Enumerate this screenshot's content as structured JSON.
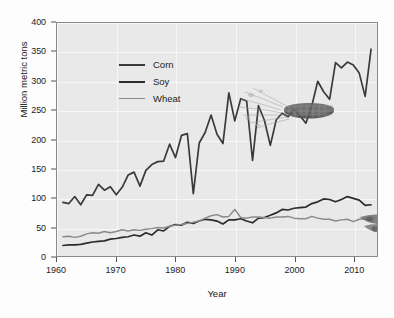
{
  "chart_data": {
    "type": "line",
    "title": "",
    "xlabel": "Year",
    "ylabel": "Million metric tons",
    "xlim": [
      1960,
      2014
    ],
    "ylim": [
      0,
      400
    ],
    "grid": true,
    "legend_position": "top-left",
    "xticks": [
      1960,
      1970,
      1980,
      1990,
      2000,
      2010
    ],
    "yticks": [
      0,
      50,
      100,
      150,
      200,
      250,
      300,
      350,
      400
    ],
    "x": [
      1961,
      1962,
      1963,
      1964,
      1965,
      1966,
      1967,
      1968,
      1969,
      1970,
      1971,
      1972,
      1973,
      1974,
      1975,
      1976,
      1977,
      1978,
      1979,
      1980,
      1981,
      1982,
      1983,
      1984,
      1985,
      1986,
      1987,
      1988,
      1989,
      1990,
      1991,
      1992,
      1993,
      1994,
      1995,
      1996,
      1997,
      1998,
      1999,
      2000,
      2001,
      2002,
      2003,
      2004,
      2005,
      2006,
      2007,
      2008,
      2009,
      2010,
      2011,
      2012,
      2013
    ],
    "series": [
      {
        "name": "Corn",
        "color": "#3a3a3a",
        "values": [
          92,
          90,
          102,
          88,
          105,
          104,
          123,
          113,
          119,
          105,
          118,
          139,
          144,
          120,
          147,
          157,
          162,
          163,
          192,
          169,
          207,
          210,
          107,
          194,
          212,
          242,
          209,
          193,
          280,
          232,
          270,
          266,
          164,
          258,
          233,
          190,
          234,
          245,
          239,
          252,
          241,
          228,
          258,
          300,
          282,
          269,
          332,
          323,
          333,
          328,
          314,
          274,
          355
        ]
      },
      {
        "name": "Soy",
        "color": "#2b2b2b",
        "values": [
          18,
          19,
          19,
          20,
          22,
          24,
          25,
          26,
          29,
          30,
          32,
          33,
          36,
          34,
          40,
          36,
          45,
          43,
          51,
          54,
          53,
          58,
          56,
          60,
          63,
          62,
          60,
          55,
          62,
          62,
          64,
          60,
          57,
          65,
          66,
          70,
          74,
          80,
          79,
          82,
          83,
          84,
          90,
          93,
          98,
          97,
          93,
          97,
          102,
          99,
          96,
          87,
          88
        ]
      },
      {
        "name": "Wheat",
        "color": "#8a8a8a",
        "values": [
          33,
          34,
          32,
          34,
          38,
          40,
          39,
          42,
          40,
          42,
          45,
          43,
          45,
          44,
          46,
          47,
          49,
          48,
          51,
          53,
          54,
          56,
          58,
          60,
          65,
          69,
          71,
          67,
          68,
          80,
          66,
          65,
          67,
          67,
          66,
          65,
          67,
          67,
          68,
          65,
          64,
          64,
          68,
          65,
          63,
          63,
          60,
          62,
          63,
          59,
          63,
          64,
          62
        ]
      }
    ]
  },
  "axes": {
    "y_title": "Million metric tons",
    "x_title": "Year",
    "y_tick_labels": [
      "0",
      "50",
      "100",
      "150",
      "200",
      "250",
      "300",
      "350",
      "400"
    ],
    "x_tick_labels": [
      "1960",
      "1970",
      "1980",
      "1990",
      "2000",
      "2010"
    ]
  },
  "legend": {
    "items": [
      {
        "label": "Corn",
        "color": "#3a3a3a"
      },
      {
        "label": "Soy",
        "color": "#2b2b2b"
      },
      {
        "label": "Wheat",
        "color": "#8a8a8a"
      }
    ]
  },
  "illustrations": [
    {
      "name": "corn-cob",
      "label": "corn"
    },
    {
      "name": "soybean-pods",
      "label": "soy"
    },
    {
      "name": "wheat-stalk",
      "label": "wheat"
    }
  ],
  "colors": {
    "plot_background": "#e9e9e9",
    "grid": "#f7f7f7",
    "frame": "#8a8a8a",
    "text": "#232323",
    "page_background": "#fdfdfd"
  }
}
